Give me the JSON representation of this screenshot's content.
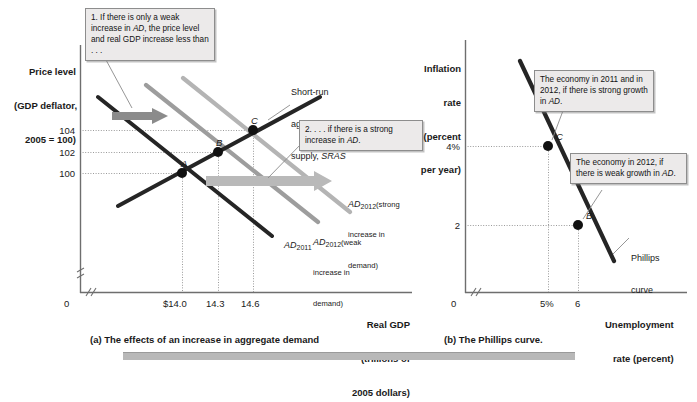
{
  "figure": {
    "panel_a_caption": "(a) The effects of an increase in aggregate demand",
    "panel_b_caption": "(b) The Phillips curve."
  },
  "panel_a": {
    "y_axis_title_line1": "Price level",
    "y_axis_title_line2": "(GDP deflator,",
    "y_axis_title_line3": "2005 = 100)",
    "x_axis_title_line1": "Real GDP",
    "x_axis_title_line2": "(trillions of",
    "x_axis_title_line3": "2005 dollars)",
    "origin_label": "0",
    "y_ticks": [
      "104",
      "102",
      "100"
    ],
    "x_ticks": [
      "$14.0",
      "14.3",
      "14.6"
    ],
    "points": [
      {
        "label": "A",
        "x": "$14.0",
        "y": "100"
      },
      {
        "label": "B",
        "x": "14.3",
        "y": "102"
      },
      {
        "label": "C",
        "x": "14.6",
        "y": "104"
      }
    ],
    "sras_label_line1": "Short-run",
    "sras_label_line2": "aggregate",
    "sras_label_line3": "supply, SRAS",
    "sras_label_italic": "SRAS",
    "ad2011_label": "AD",
    "ad2011_sub": "2011",
    "ad2012_strong_label": "AD",
    "ad2012_strong_sub": "2012",
    "ad2012_strong_note_line1": "(strong",
    "ad2012_strong_note_line2": "increase in",
    "ad2012_strong_note_line3": "demand)",
    "ad2012_weak_label": "AD",
    "ad2012_weak_sub": "2012",
    "ad2012_weak_note_line1": "(weak",
    "ad2012_weak_note_line2": "increase in",
    "ad2012_weak_note_line3": "demand)",
    "callout_1": "1. If there is only a weak increase in AD, the price level and real GDP increase less than . . .",
    "callout_1_italic": "AD",
    "callout_2": "2. . . . if there is a strong increase in AD.",
    "callout_2_italic": "AD"
  },
  "panel_b": {
    "y_axis_title_line1": "Inflation",
    "y_axis_title_line2": "rate",
    "y_axis_title_line3": "(percent",
    "y_axis_title_line4": "per year)",
    "x_axis_title_line1": "Unemployment",
    "x_axis_title_line2": "rate (percent)",
    "origin_label": "0",
    "y_ticks": [
      "4%",
      "2"
    ],
    "x_ticks": [
      "5%",
      "6"
    ],
    "points": [
      {
        "label": "C",
        "x": "5%",
        "y": "4%"
      },
      {
        "label": "B",
        "x": "6",
        "y": "2"
      }
    ],
    "curve_label_line1": "Phillips",
    "curve_label_line2": "curve",
    "callout_c": "The economy in 2011 and in 2012, if there is strong growth in AD.",
    "callout_c_italic": "AD",
    "callout_b": "The economy in 2012, if there is weak growth in AD.",
    "callout_b_italic": "AD"
  },
  "chart_data": [
    {
      "type": "line",
      "title": "(a) The effects of an increase in aggregate demand",
      "xlabel": "Real GDP (trillions of 2005 dollars)",
      "ylabel": "Price level (GDP deflator, 2005 = 100)",
      "xticks": [
        "$14.0",
        "14.3",
        "14.6"
      ],
      "yticks": [
        "104",
        "102",
        "100"
      ],
      "grid": "dotted-guides",
      "legend": "inline-labels",
      "series": [
        {
          "name": "Short-run aggregate supply, SRAS",
          "slope": "upward",
          "points": [
            [
              13.55,
              98.3
            ],
            [
              14.85,
              105.1
            ]
          ]
        },
        {
          "name": "AD2011",
          "slope": "downward",
          "points": [
            [
              13.3,
              106.2
            ],
            [
              14.95,
              95.5
            ]
          ]
        },
        {
          "name": "AD2012 (weak increase in demand)",
          "slope": "downward",
          "points": [
            [
              13.75,
              107.4
            ],
            [
              15.3,
              97.2
            ]
          ]
        },
        {
          "name": "AD2012 (strong increase in demand)",
          "slope": "downward",
          "points": [
            [
              14.1,
              108.2
            ],
            [
              15.55,
              98.6
            ]
          ]
        }
      ],
      "equilibria": [
        {
          "label": "A",
          "x": 14.0,
          "y": 100
        },
        {
          "label": "B",
          "x": 14.3,
          "y": 102
        },
        {
          "label": "C",
          "x": 14.6,
          "y": 104
        }
      ]
    },
    {
      "type": "line",
      "title": "(b) The Phillips curve.",
      "xlabel": "Unemployment rate (percent)",
      "ylabel": "Inflation rate (percent per year)",
      "xticks": [
        "5%",
        "6"
      ],
      "yticks": [
        "4%",
        "2"
      ],
      "grid": "dotted-guides",
      "series": [
        {
          "name": "Phillips curve",
          "slope": "downward",
          "points": [
            [
              4.2,
              6.2
            ],
            [
              6.7,
              1.0
            ]
          ]
        }
      ],
      "equilibria": [
        {
          "label": "C",
          "x": 5,
          "y": 4
        },
        {
          "label": "B",
          "x": 6,
          "y": 2
        }
      ]
    }
  ]
}
